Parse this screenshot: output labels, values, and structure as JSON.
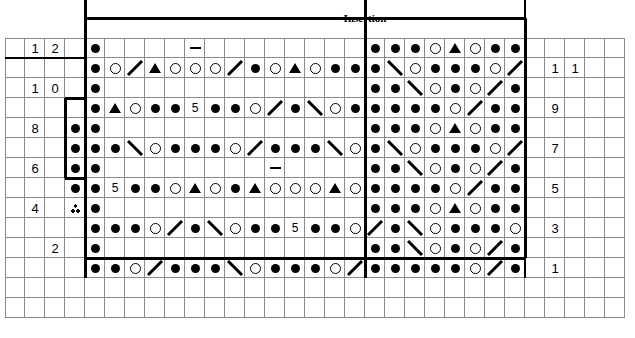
{
  "title": "Insertion",
  "chart_data": {
    "type": "table",
    "title": "Insertion",
    "grid": {
      "columns": 31,
      "rows": 14,
      "cell_size": 20,
      "origin_x": 5,
      "origin_y": 38,
      "grid_line_color": "#8a8a8a",
      "heavy_line_color": "#000000"
    },
    "legend_symbols": [
      "dot",
      "circle",
      "triangle",
      "dash",
      "slash-right",
      "slash-left",
      "number",
      "three-dot"
    ],
    "left_row_numbers": [
      "12",
      "10",
      "8",
      "6",
      "4",
      "2"
    ],
    "right_row_numbers": [
      "11",
      "9",
      "7",
      "5",
      "3",
      "1"
    ],
    "row_number_left_values": [
      {
        "label": "1",
        "col": 1,
        "row": 12
      },
      {
        "label": "2",
        "col": 2,
        "row": 12
      },
      {
        "label": "1",
        "col": 1,
        "row": 10
      },
      {
        "label": "0",
        "col": 2,
        "row": 10
      },
      {
        "label": "8",
        "col": 1,
        "row": 8
      },
      {
        "label": "6",
        "col": 1,
        "row": 6
      },
      {
        "label": "4",
        "col": 1,
        "row": 4
      },
      {
        "label": "2",
        "col": 2,
        "row": 2
      }
    ],
    "row_number_right_values": [
      {
        "label": "1",
        "col": 27,
        "row": 11
      },
      {
        "label": "1",
        "col": 28,
        "row": 11
      },
      {
        "label": "9",
        "col": 27,
        "row": 9
      },
      {
        "label": "7",
        "col": 27,
        "row": 7
      },
      {
        "label": "5",
        "col": 27,
        "row": 5
      },
      {
        "label": "3",
        "col": 27,
        "row": 3
      },
      {
        "label": "1",
        "col": 27,
        "row": 1
      }
    ],
    "heavy_rules": [
      {
        "name": "vertical-left-main",
        "type": "v",
        "col": 4,
        "from_row": 14,
        "to_row": 0,
        "width": 3
      },
      {
        "name": "vertical-insertion",
        "type": "v",
        "col": 18,
        "from_row": 14,
        "to_row": 0,
        "width": 3
      },
      {
        "name": "box-top",
        "type": "h",
        "row": 13,
        "from_col": 4,
        "to_col": 26,
        "width": 3
      },
      {
        "name": "box-bottom",
        "type": "h",
        "row": 1,
        "from_col": 4,
        "to_col": 26,
        "width": 3
      },
      {
        "name": "box-right",
        "type": "v",
        "col": 26,
        "from_row": 13,
        "to_row": 1,
        "width": 3
      },
      {
        "name": "divider-row-11",
        "type": "h",
        "row": 11,
        "from_col": 0,
        "to_col": 4,
        "width": 2
      },
      {
        "name": "notch-left",
        "type": "v",
        "col": 3,
        "from_row": 9,
        "to_row": 5,
        "width": 3
      },
      {
        "name": "notch-top",
        "type": "h",
        "row": 9,
        "from_col": 3,
        "to_col": 4,
        "width": 3
      },
      {
        "name": "notch-bottom",
        "type": "h",
        "row": 5,
        "from_col": 3,
        "to_col": 4,
        "width": 3
      },
      {
        "name": "right-edge-rule",
        "type": "v",
        "col": 26,
        "from_row": 14,
        "to_row": 0,
        "width": 2
      }
    ],
    "symbols": [
      {
        "col": 4,
        "row": 12,
        "sym": "dot"
      },
      {
        "col": 9,
        "row": 12,
        "sym": "dash"
      },
      {
        "col": 18,
        "row": 12,
        "sym": "dot"
      },
      {
        "col": 19,
        "row": 12,
        "sym": "dot"
      },
      {
        "col": 20,
        "row": 12,
        "sym": "dot"
      },
      {
        "col": 21,
        "row": 12,
        "sym": "circle"
      },
      {
        "col": 22,
        "row": 12,
        "sym": "triangle"
      },
      {
        "col": 23,
        "row": 12,
        "sym": "circle"
      },
      {
        "col": 24,
        "row": 12,
        "sym": "dot"
      },
      {
        "col": 25,
        "row": 12,
        "sym": "dot"
      },
      {
        "col": 4,
        "row": 11,
        "sym": "dot"
      },
      {
        "col": 5,
        "row": 11,
        "sym": "circle"
      },
      {
        "col": 6,
        "row": 11,
        "sym": "slash-right"
      },
      {
        "col": 7,
        "row": 11,
        "sym": "triangle"
      },
      {
        "col": 8,
        "row": 11,
        "sym": "circle"
      },
      {
        "col": 9,
        "row": 11,
        "sym": "circle"
      },
      {
        "col": 10,
        "row": 11,
        "sym": "circle"
      },
      {
        "col": 11,
        "row": 11,
        "sym": "slash-right"
      },
      {
        "col": 12,
        "row": 11,
        "sym": "dot"
      },
      {
        "col": 13,
        "row": 11,
        "sym": "circle"
      },
      {
        "col": 14,
        "row": 11,
        "sym": "triangle"
      },
      {
        "col": 15,
        "row": 11,
        "sym": "circle"
      },
      {
        "col": 16,
        "row": 11,
        "sym": "dot"
      },
      {
        "col": 17,
        "row": 11,
        "sym": "dot"
      },
      {
        "col": 18,
        "row": 11,
        "sym": "dot"
      },
      {
        "col": 19,
        "row": 11,
        "sym": "slash-left"
      },
      {
        "col": 20,
        "row": 11,
        "sym": "circle"
      },
      {
        "col": 21,
        "row": 11,
        "sym": "dot"
      },
      {
        "col": 22,
        "row": 11,
        "sym": "dot"
      },
      {
        "col": 23,
        "row": 11,
        "sym": "dot"
      },
      {
        "col": 24,
        "row": 11,
        "sym": "circle"
      },
      {
        "col": 25,
        "row": 11,
        "sym": "slash-right"
      },
      {
        "col": 4,
        "row": 10,
        "sym": "dot"
      },
      {
        "col": 18,
        "row": 10,
        "sym": "dot"
      },
      {
        "col": 19,
        "row": 10,
        "sym": "dot"
      },
      {
        "col": 20,
        "row": 10,
        "sym": "slash-left"
      },
      {
        "col": 21,
        "row": 10,
        "sym": "circle"
      },
      {
        "col": 22,
        "row": 10,
        "sym": "dot"
      },
      {
        "col": 23,
        "row": 10,
        "sym": "circle"
      },
      {
        "col": 24,
        "row": 10,
        "sym": "slash-right"
      },
      {
        "col": 25,
        "row": 10,
        "sym": "dot"
      },
      {
        "col": 4,
        "row": 9,
        "sym": "dot"
      },
      {
        "col": 5,
        "row": 9,
        "sym": "triangle"
      },
      {
        "col": 6,
        "row": 9,
        "sym": "circle"
      },
      {
        "col": 7,
        "row": 9,
        "sym": "dot"
      },
      {
        "col": 8,
        "row": 9,
        "sym": "dot"
      },
      {
        "col": 9,
        "row": 9,
        "sym": "num5"
      },
      {
        "col": 10,
        "row": 9,
        "sym": "dot"
      },
      {
        "col": 11,
        "row": 9,
        "sym": "dot"
      },
      {
        "col": 12,
        "row": 9,
        "sym": "circle"
      },
      {
        "col": 13,
        "row": 9,
        "sym": "slash-right"
      },
      {
        "col": 14,
        "row": 9,
        "sym": "dot"
      },
      {
        "col": 15,
        "row": 9,
        "sym": "slash-left"
      },
      {
        "col": 16,
        "row": 9,
        "sym": "circle"
      },
      {
        "col": 17,
        "row": 9,
        "sym": "dot"
      },
      {
        "col": 18,
        "row": 9,
        "sym": "dot"
      },
      {
        "col": 19,
        "row": 9,
        "sym": "dot"
      },
      {
        "col": 20,
        "row": 9,
        "sym": "dot"
      },
      {
        "col": 21,
        "row": 9,
        "sym": "dot"
      },
      {
        "col": 22,
        "row": 9,
        "sym": "circle"
      },
      {
        "col": 23,
        "row": 9,
        "sym": "slash-right"
      },
      {
        "col": 24,
        "row": 9,
        "sym": "dot"
      },
      {
        "col": 25,
        "row": 9,
        "sym": "dot"
      },
      {
        "col": 3,
        "row": 8,
        "sym": "dot"
      },
      {
        "col": 4,
        "row": 8,
        "sym": "dot"
      },
      {
        "col": 18,
        "row": 8,
        "sym": "dot"
      },
      {
        "col": 19,
        "row": 8,
        "sym": "dot"
      },
      {
        "col": 20,
        "row": 8,
        "sym": "dot"
      },
      {
        "col": 21,
        "row": 8,
        "sym": "circle"
      },
      {
        "col": 22,
        "row": 8,
        "sym": "triangle"
      },
      {
        "col": 23,
        "row": 8,
        "sym": "circle"
      },
      {
        "col": 24,
        "row": 8,
        "sym": "dot"
      },
      {
        "col": 25,
        "row": 8,
        "sym": "dot"
      },
      {
        "col": 3,
        "row": 7,
        "sym": "dot"
      },
      {
        "col": 4,
        "row": 7,
        "sym": "dot"
      },
      {
        "col": 5,
        "row": 7,
        "sym": "dot"
      },
      {
        "col": 6,
        "row": 7,
        "sym": "slash-left"
      },
      {
        "col": 7,
        "row": 7,
        "sym": "circle"
      },
      {
        "col": 8,
        "row": 7,
        "sym": "dot"
      },
      {
        "col": 9,
        "row": 7,
        "sym": "dot"
      },
      {
        "col": 10,
        "row": 7,
        "sym": "dot"
      },
      {
        "col": 11,
        "row": 7,
        "sym": "circle"
      },
      {
        "col": 12,
        "row": 7,
        "sym": "slash-right"
      },
      {
        "col": 13,
        "row": 7,
        "sym": "dot"
      },
      {
        "col": 14,
        "row": 7,
        "sym": "dot"
      },
      {
        "col": 15,
        "row": 7,
        "sym": "dot"
      },
      {
        "col": 16,
        "row": 7,
        "sym": "slash-left"
      },
      {
        "col": 17,
        "row": 7,
        "sym": "circle"
      },
      {
        "col": 18,
        "row": 7,
        "sym": "dot"
      },
      {
        "col": 19,
        "row": 7,
        "sym": "slash-left"
      },
      {
        "col": 20,
        "row": 7,
        "sym": "circle"
      },
      {
        "col": 21,
        "row": 7,
        "sym": "dot"
      },
      {
        "col": 22,
        "row": 7,
        "sym": "dot"
      },
      {
        "col": 23,
        "row": 7,
        "sym": "dot"
      },
      {
        "col": 24,
        "row": 7,
        "sym": "circle"
      },
      {
        "col": 25,
        "row": 7,
        "sym": "slash-right"
      },
      {
        "col": 3,
        "row": 6,
        "sym": "dot"
      },
      {
        "col": 4,
        "row": 6,
        "sym": "dot"
      },
      {
        "col": 13,
        "row": 6,
        "sym": "dash"
      },
      {
        "col": 18,
        "row": 6,
        "sym": "dot"
      },
      {
        "col": 19,
        "row": 6,
        "sym": "dot"
      },
      {
        "col": 20,
        "row": 6,
        "sym": "slash-left"
      },
      {
        "col": 21,
        "row": 6,
        "sym": "circle"
      },
      {
        "col": 22,
        "row": 6,
        "sym": "dot"
      },
      {
        "col": 23,
        "row": 6,
        "sym": "circle"
      },
      {
        "col": 24,
        "row": 6,
        "sym": "slash-right"
      },
      {
        "col": 25,
        "row": 6,
        "sym": "dot"
      },
      {
        "col": 3,
        "row": 5,
        "sym": "dot"
      },
      {
        "col": 4,
        "row": 5,
        "sym": "dot"
      },
      {
        "col": 5,
        "row": 5,
        "sym": "num5"
      },
      {
        "col": 6,
        "row": 5,
        "sym": "dot"
      },
      {
        "col": 7,
        "row": 5,
        "sym": "dot"
      },
      {
        "col": 8,
        "row": 5,
        "sym": "circle"
      },
      {
        "col": 9,
        "row": 5,
        "sym": "triangle"
      },
      {
        "col": 10,
        "row": 5,
        "sym": "circle"
      },
      {
        "col": 11,
        "row": 5,
        "sym": "dot"
      },
      {
        "col": 12,
        "row": 5,
        "sym": "triangle"
      },
      {
        "col": 13,
        "row": 5,
        "sym": "circle"
      },
      {
        "col": 14,
        "row": 5,
        "sym": "circle"
      },
      {
        "col": 15,
        "row": 5,
        "sym": "circle"
      },
      {
        "col": 16,
        "row": 5,
        "sym": "triangle"
      },
      {
        "col": 17,
        "row": 5,
        "sym": "circle"
      },
      {
        "col": 18,
        "row": 5,
        "sym": "dot"
      },
      {
        "col": 19,
        "row": 5,
        "sym": "dot"
      },
      {
        "col": 20,
        "row": 5,
        "sym": "dot"
      },
      {
        "col": 21,
        "row": 5,
        "sym": "dot"
      },
      {
        "col": 22,
        "row": 5,
        "sym": "circle"
      },
      {
        "col": 23,
        "row": 5,
        "sym": "slash-right"
      },
      {
        "col": 24,
        "row": 5,
        "sym": "dot"
      },
      {
        "col": 25,
        "row": 5,
        "sym": "dot"
      },
      {
        "col": 3,
        "row": 4,
        "sym": "three-dot"
      },
      {
        "col": 4,
        "row": 4,
        "sym": "dot"
      },
      {
        "col": 18,
        "row": 4,
        "sym": "dot"
      },
      {
        "col": 19,
        "row": 4,
        "sym": "dot"
      },
      {
        "col": 20,
        "row": 4,
        "sym": "dot"
      },
      {
        "col": 21,
        "row": 4,
        "sym": "circle"
      },
      {
        "col": 22,
        "row": 4,
        "sym": "triangle"
      },
      {
        "col": 23,
        "row": 4,
        "sym": "circle"
      },
      {
        "col": 24,
        "row": 4,
        "sym": "dot"
      },
      {
        "col": 25,
        "row": 4,
        "sym": "dot"
      },
      {
        "col": 4,
        "row": 3,
        "sym": "dot"
      },
      {
        "col": 5,
        "row": 3,
        "sym": "dot"
      },
      {
        "col": 6,
        "row": 3,
        "sym": "dot"
      },
      {
        "col": 7,
        "row": 3,
        "sym": "circle"
      },
      {
        "col": 8,
        "row": 3,
        "sym": "slash-right"
      },
      {
        "col": 9,
        "row": 3,
        "sym": "dot"
      },
      {
        "col": 10,
        "row": 3,
        "sym": "slash-left"
      },
      {
        "col": 11,
        "row": 3,
        "sym": "circle"
      },
      {
        "col": 12,
        "row": 3,
        "sym": "dot"
      },
      {
        "col": 13,
        "row": 3,
        "sym": "dot"
      },
      {
        "col": 14,
        "row": 3,
        "sym": "num5"
      },
      {
        "col": 15,
        "row": 3,
        "sym": "dot"
      },
      {
        "col": 16,
        "row": 3,
        "sym": "dot"
      },
      {
        "col": 17,
        "row": 3,
        "sym": "circle"
      },
      {
        "col": 18,
        "row": 3,
        "sym": "slash-right"
      },
      {
        "col": 19,
        "row": 3,
        "sym": "dot"
      },
      {
        "col": 20,
        "row": 3,
        "sym": "slash-left"
      },
      {
        "col": 21,
        "row": 3,
        "sym": "circle"
      },
      {
        "col": 22,
        "row": 3,
        "sym": "dot"
      },
      {
        "col": 23,
        "row": 3,
        "sym": "dot"
      },
      {
        "col": 24,
        "row": 3,
        "sym": "dot"
      },
      {
        "col": 25,
        "row": 3,
        "sym": "circle"
      },
      {
        "col": 4,
        "row": 2,
        "sym": "dot"
      },
      {
        "col": 18,
        "row": 2,
        "sym": "dot"
      },
      {
        "col": 19,
        "row": 2,
        "sym": "dot"
      },
      {
        "col": 20,
        "row": 2,
        "sym": "slash-left"
      },
      {
        "col": 21,
        "row": 2,
        "sym": "circle"
      },
      {
        "col": 22,
        "row": 2,
        "sym": "dot"
      },
      {
        "col": 23,
        "row": 2,
        "sym": "circle"
      },
      {
        "col": 24,
        "row": 2,
        "sym": "slash-right"
      },
      {
        "col": 25,
        "row": 2,
        "sym": "dot"
      },
      {
        "col": 4,
        "row": 1,
        "sym": "dot"
      },
      {
        "col": 5,
        "row": 1,
        "sym": "dot"
      },
      {
        "col": 6,
        "row": 1,
        "sym": "circle"
      },
      {
        "col": 7,
        "row": 1,
        "sym": "slash-right"
      },
      {
        "col": 8,
        "row": 1,
        "sym": "dot"
      },
      {
        "col": 9,
        "row": 1,
        "sym": "dot"
      },
      {
        "col": 10,
        "row": 1,
        "sym": "dot"
      },
      {
        "col": 11,
        "row": 1,
        "sym": "slash-left"
      },
      {
        "col": 12,
        "row": 1,
        "sym": "circle"
      },
      {
        "col": 13,
        "row": 1,
        "sym": "dot"
      },
      {
        "col": 14,
        "row": 1,
        "sym": "dot"
      },
      {
        "col": 15,
        "row": 1,
        "sym": "dot"
      },
      {
        "col": 16,
        "row": 1,
        "sym": "circle"
      },
      {
        "col": 17,
        "row": 1,
        "sym": "slash-right"
      },
      {
        "col": 18,
        "row": 1,
        "sym": "dot"
      },
      {
        "col": 19,
        "row": 1,
        "sym": "dot"
      },
      {
        "col": 20,
        "row": 1,
        "sym": "dot"
      },
      {
        "col": 21,
        "row": 1,
        "sym": "dot"
      },
      {
        "col": 22,
        "row": 1,
        "sym": "dot"
      },
      {
        "col": 23,
        "row": 1,
        "sym": "circle"
      },
      {
        "col": 24,
        "row": 1,
        "sym": "slash-right"
      },
      {
        "col": 25,
        "row": 1,
        "sym": "dot"
      }
    ]
  }
}
